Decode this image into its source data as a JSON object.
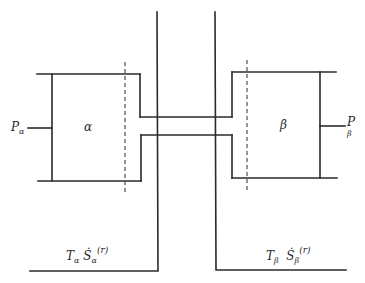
{
  "diagram": {
    "type": "two-chamber thermodynamic system connected by a channel",
    "stroke_color": "#2a2a2a",
    "chambers": [
      {
        "id": "alpha",
        "label": "α",
        "pressure_label": {
          "main": "P",
          "sub": "α"
        },
        "heat_label": {
          "T_main": "T",
          "T_sub": "α",
          "S_main": "Ṡ",
          "S_sub": "α",
          "S_sup": "(r)"
        }
      },
      {
        "id": "beta",
        "label": "β",
        "pressure_label": {
          "main": "P",
          "sub": "β"
        },
        "heat_label": {
          "T_main": "T",
          "T_sub": "β",
          "S_main": "Ṡ",
          "S_sub": "β",
          "S_sup": "(r)"
        }
      }
    ],
    "channel": {
      "description": "narrow connecting tube between chambers"
    },
    "dashed_boundaries": 2
  }
}
